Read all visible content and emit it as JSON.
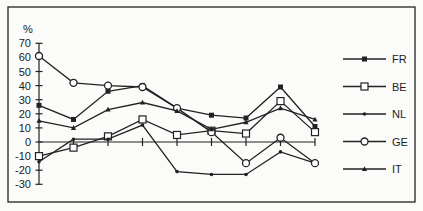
{
  "chart_data": {
    "type": "line",
    "title": "",
    "xlabel": "",
    "ylabel": "%",
    "ylim": [
      -30,
      70
    ],
    "yticks": [
      70,
      60,
      50,
      40,
      30,
      20,
      10,
      0,
      -10,
      -20,
      -30
    ],
    "x": [
      1,
      2,
      3,
      4,
      5,
      6,
      7,
      8,
      9
    ],
    "x_tick_labels_visible": false,
    "grid": false,
    "legend_position": "right",
    "series": [
      {
        "name": "FR",
        "marker": "filled-square",
        "values": [
          26,
          16,
          36,
          40,
          24,
          19,
          17,
          39,
          11
        ]
      },
      {
        "name": "BE",
        "marker": "open-square",
        "values": [
          -10,
          -4,
          4,
          16,
          5,
          8,
          6,
          29,
          7
        ]
      },
      {
        "name": "NL",
        "marker": "small-dot",
        "values": [
          -14,
          2,
          2,
          12,
          -21,
          -23,
          -23,
          -7,
          -15
        ]
      },
      {
        "name": "GE",
        "marker": "open-circle",
        "values": [
          61,
          42,
          40,
          39,
          24,
          7,
          -15,
          3,
          -15
        ]
      },
      {
        "name": "IT",
        "marker": "filled-triangle",
        "values": [
          15,
          10,
          23,
          28,
          22,
          9,
          14,
          24,
          16
        ]
      }
    ]
  },
  "legend": {
    "items": [
      "FR",
      "BE",
      "NL",
      "GE",
      "IT"
    ]
  },
  "axis": {
    "y_unit": "%"
  }
}
